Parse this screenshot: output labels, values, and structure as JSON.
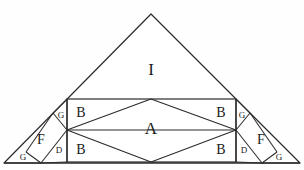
{
  "figure": {
    "stroke_color": "#2b2b2b",
    "fill_color": "#ffffff",
    "background_color": "#fefefe",
    "canvas": {
      "width": 304,
      "height": 170
    },
    "outline": {
      "name": "large-isosceles-triangle",
      "apex": {
        "x": 151,
        "y": 14
      },
      "base_left": {
        "x": 4,
        "y": 163
      },
      "base_right": {
        "x": 300,
        "y": 163
      }
    },
    "band": {
      "name": "central-rectangle",
      "left": 67,
      "right": 236,
      "top": 99,
      "bottom": 162,
      "middle_y": 130
    },
    "rhombus": {
      "name": "rhombus-A",
      "top": {
        "x": 151,
        "y": 99
      },
      "left": {
        "x": 67,
        "y": 130
      },
      "bottom": {
        "x": 151,
        "y": 162
      },
      "right": {
        "x": 236,
        "y": 130
      }
    },
    "labels": [
      {
        "id": "label-I",
        "text": "I",
        "x": 151,
        "y": 69,
        "size": "big"
      },
      {
        "id": "label-A",
        "text": "A",
        "x": 151,
        "y": 128,
        "size": "big"
      },
      {
        "id": "label-B-top-left",
        "text": "B",
        "x": 81,
        "y": 113,
        "size": "med"
      },
      {
        "id": "label-B-top-right",
        "text": "B",
        "x": 221,
        "y": 113,
        "size": "med"
      },
      {
        "id": "label-B-bottom-left",
        "text": "B",
        "x": 81,
        "y": 150,
        "size": "med"
      },
      {
        "id": "label-B-bottom-right",
        "text": "B",
        "x": 221,
        "y": 150,
        "size": "med"
      },
      {
        "id": "label-F-left",
        "text": "F",
        "x": 41,
        "y": 140,
        "size": "med"
      },
      {
        "id": "label-F-right",
        "text": "F",
        "x": 261,
        "y": 140,
        "size": "med"
      },
      {
        "id": "label-G-upper-left",
        "text": "G",
        "x": 61,
        "y": 115,
        "size": "small"
      },
      {
        "id": "label-G-upper-right",
        "text": "G",
        "x": 242,
        "y": 115,
        "size": "small"
      },
      {
        "id": "label-G-corner-left",
        "text": "G",
        "x": 23,
        "y": 157,
        "size": "small"
      },
      {
        "id": "label-G-corner-right",
        "text": "G",
        "x": 279,
        "y": 157,
        "size": "small"
      },
      {
        "id": "label-D-left",
        "text": "D",
        "x": 59,
        "y": 150,
        "size": "small"
      },
      {
        "id": "label-D-right",
        "text": "D",
        "x": 244,
        "y": 150,
        "size": "small"
      }
    ],
    "regions": [
      {
        "id": "region-I",
        "label": "I",
        "description": "upper-triangle"
      },
      {
        "id": "region-A",
        "label": "A",
        "description": "central-rhombus"
      },
      {
        "id": "region-B",
        "label": "B",
        "description": "corner-piece",
        "count": 4
      },
      {
        "id": "region-F",
        "label": "F",
        "description": "slanted-parallelogram",
        "count": 2
      },
      {
        "id": "region-G",
        "label": "G",
        "description": "small-right-triangle",
        "count": 4
      },
      {
        "id": "region-D",
        "label": "D",
        "description": "small-sliver-triangle",
        "count": 2
      }
    ]
  }
}
